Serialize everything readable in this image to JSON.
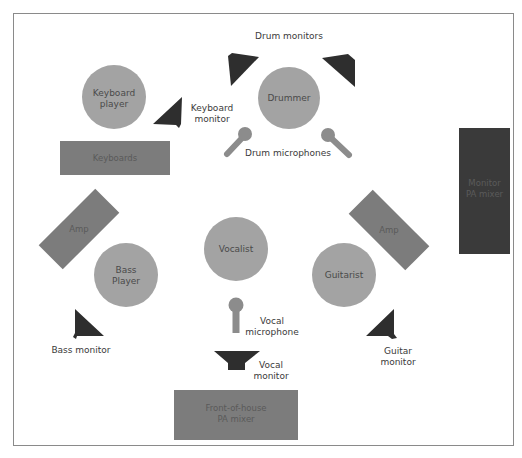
{
  "colors": {
    "frame": "#8a8a8a",
    "person": "#a3a3a3",
    "equipment": "#7c7c7c",
    "monitor": "#2e2e2e",
    "monitor_mixer": "#3a3a3a",
    "microphone": "#8c8c8c",
    "label": "#3a3a3a"
  },
  "people": {
    "keyboard_player": {
      "line1": "Keyboard",
      "line2": "player"
    },
    "drummer": {
      "label": "Drummer"
    },
    "vocalist": {
      "label": "Vocalist"
    },
    "bass_player": {
      "line1": "Bass",
      "line2": "Player"
    },
    "guitarist": {
      "label": "Guitarist"
    }
  },
  "equipment": {
    "keyboards": {
      "label": "Keyboards"
    },
    "left_amp": {
      "label": "Amp"
    },
    "right_amp": {
      "label": "Amp"
    },
    "monitor_mixer": {
      "line1": "Monitor",
      "line2": "PA mixer"
    },
    "foh_mixer": {
      "line1": "Front-of-house",
      "line2": "PA mixer"
    }
  },
  "labels": {
    "drum_monitors": "Drum monitors",
    "keyboard_monitor": {
      "line1": "Keyboard",
      "line2": "monitor"
    },
    "drum_microphones": "Drum microphones",
    "vocal_microphone": {
      "line1": "Vocal",
      "line2": "microphone"
    },
    "vocal_monitor": {
      "line1": "Vocal",
      "line2": "monitor"
    },
    "bass_monitor": "Bass monitor",
    "guitar_monitor": {
      "line1": "Guitar",
      "line2": "monitor"
    }
  }
}
